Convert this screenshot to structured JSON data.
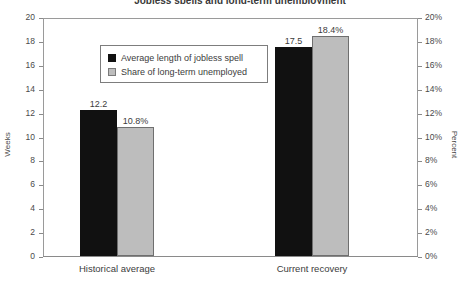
{
  "chart_data": {
    "type": "bar",
    "title": "Jobless spells and long-term unemployment",
    "categories": [
      "Historical average",
      "Current recovery"
    ],
    "series": [
      {
        "name": "Average length of jobless spell",
        "axis": "left",
        "unit": "Weeks",
        "values": [
          12.2,
          17.5
        ],
        "labels": [
          "12.2",
          "17.5"
        ],
        "color": "#111111"
      },
      {
        "name": "Share of long-term unemployed",
        "axis": "right",
        "unit": "Percent",
        "values": [
          10.8,
          18.4
        ],
        "labels": [
          "10.8%",
          "18.4%"
        ],
        "color": "#bdbdbd"
      }
    ],
    "xlabel": "",
    "ylabel": "Weeks",
    "ylabel_right": "Percent",
    "ylim": [
      0,
      20
    ],
    "ylim_right": [
      0,
      20
    ],
    "ytick_labels": [
      "20",
      "18",
      "16",
      "14",
      "12",
      "10",
      "8",
      "6",
      "4",
      "2",
      "0"
    ],
    "ytick_values": [
      20,
      18,
      16,
      14,
      12,
      10,
      8,
      6,
      4,
      2,
      0
    ],
    "ytick_labels_right": [
      "20%",
      "18%",
      "16%",
      "14%",
      "12%",
      "10%",
      "8%",
      "6%",
      "4%",
      "2%",
      "0%"
    ],
    "ytick_values_right": [
      20,
      18,
      16,
      14,
      12,
      10,
      8,
      6,
      4,
      2,
      0
    ],
    "grid": false,
    "legend_position": "upper-left",
    "legend_entries": [
      "Average length of jobless spell",
      "Share of long-term unemployed"
    ]
  },
  "axes": {
    "left_title": "Weeks",
    "right_title": "Percent"
  }
}
